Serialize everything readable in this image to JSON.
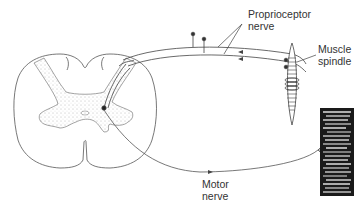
{
  "diagram": {
    "labels": {
      "proprioceptor_line1": "Proprioceptor",
      "proprioceptor_line2": "nerve",
      "spindle_line1": "Muscle",
      "spindle_line2": "spindle",
      "motor_line1": "Motor",
      "motor_line2": "nerve"
    },
    "components": [
      "spinal-cord-cross-section",
      "grey-matter",
      "proprioceptor-nerve",
      "dorsal-root-ganglion-cells",
      "muscle-spindle",
      "motor-nerve",
      "skeletal-muscle"
    ],
    "colors": {
      "line": "#444444",
      "muscle": "#1a1a1a",
      "background": "#ffffff"
    }
  }
}
